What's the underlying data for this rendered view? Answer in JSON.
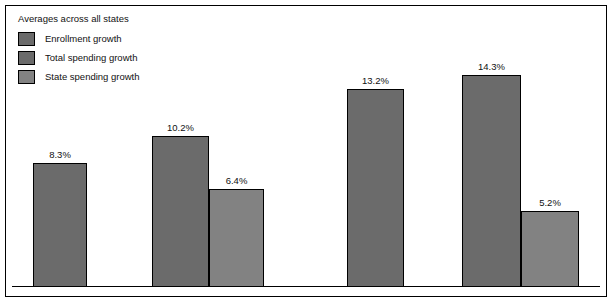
{
  "legend": {
    "title": "Averages across all states",
    "items": [
      {
        "label": "Enrollment growth",
        "color": "#6b6b6b",
        "icon": "legend-swatch-icon"
      },
      {
        "label": "Total spending growth",
        "color": "#6b6b6b",
        "icon": "legend-swatch-icon"
      },
      {
        "label": "State spending growth",
        "color": "#828282",
        "icon": "legend-swatch-icon"
      }
    ]
  },
  "colors": {
    "enrollment_growth": "#6b6b6b",
    "total_spending_growth": "#6b6b6b",
    "state_spending_growth": "#828282",
    "border": "#000000",
    "background": "#ffffff",
    "text": "#111111"
  },
  "bars": [
    {
      "label": "8.3%",
      "value": 8.3,
      "series": "Enrollment growth",
      "color": "#6b6b6b",
      "left": 27,
      "width": 54,
      "height": 124
    },
    {
      "label": "10.2%",
      "value": 10.2,
      "series": "Total spending growth",
      "color": "#6b6b6b",
      "left": 146,
      "width": 57,
      "height": 151
    },
    {
      "label": "6.4%",
      "value": 6.4,
      "series": "State spending growth",
      "color": "#828282",
      "left": 203,
      "width": 55,
      "height": 98
    },
    {
      "label": "13.2%",
      "value": 13.2,
      "series": "Enrollment growth",
      "color": "#6b6b6b",
      "left": 341,
      "width": 57,
      "height": 198
    },
    {
      "label": "14.3%",
      "value": 14.3,
      "series": "Total spending growth",
      "color": "#6b6b6b",
      "left": 456,
      "width": 59,
      "height": 212
    },
    {
      "label": "5.2%",
      "value": 5.2,
      "series": "State spending growth",
      "color": "#828282",
      "left": 515,
      "width": 58,
      "height": 76
    }
  ],
  "chart_data": {
    "type": "bar",
    "title": "Averages across all states",
    "xlabel": "",
    "ylabel": "",
    "ylim": [
      0,
      16
    ],
    "grid": false,
    "legend_position": "top-left",
    "categories": [
      "Group 1",
      "Group 2"
    ],
    "series": [
      {
        "name": "Enrollment growth",
        "values": [
          8.3,
          13.2
        ]
      },
      {
        "name": "Total spending growth",
        "values": [
          10.2,
          14.3
        ]
      },
      {
        "name": "State spending growth",
        "values": [
          6.4,
          5.2
        ]
      }
    ],
    "data_labels": [
      "8.3%",
      "10.2%",
      "6.4%",
      "13.2%",
      "14.3%",
      "5.2%"
    ],
    "values_flat": [
      8.3,
      10.2,
      6.4,
      13.2,
      14.3,
      5.2
    ],
    "units": "percent",
    "annotations": []
  }
}
